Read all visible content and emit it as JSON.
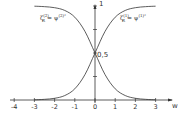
{
  "chart_data": {
    "type": "line",
    "title": "",
    "xlabel": "w",
    "ylabel": "",
    "xlim": [
      -4,
      3.5
    ],
    "ylim": [
      0,
      1
    ],
    "x_ticks": [
      "-4",
      "-3",
      "-2",
      "-1",
      "0",
      "1",
      "2",
      "3"
    ],
    "y_tick_labels": [
      "0,5",
      "1"
    ],
    "grid": false,
    "legend": "inline labels",
    "series": [
      {
        "name": "ζ_R^(2) = ψ^(2)²",
        "label_base": "ζ",
        "label_sup": "(2)",
        "label_sub": "R",
        "label_rhs": "= ψ",
        "label_rhs_sup": "(2)²",
        "x": [
          -3,
          -2.5,
          -2,
          -1.5,
          -1,
          -0.5,
          0,
          0.5,
          1,
          1.5,
          2,
          2.5,
          3
        ],
        "values": [
          0.998,
          0.993,
          0.982,
          0.953,
          0.881,
          0.731,
          0.5,
          0.269,
          0.119,
          0.047,
          0.018,
          0.007,
          0.002
        ]
      },
      {
        "name": "ζ_R^(1) = ψ^(1)²",
        "label_base": "ζ",
        "label_sup": "(1)",
        "label_sub": "R",
        "label_rhs": "= ψ",
        "label_rhs_sup": "(1)²",
        "x": [
          -3,
          -2.5,
          -2,
          -1.5,
          -1,
          -0.5,
          0,
          0.5,
          1,
          1.5,
          2,
          2.5,
          3
        ],
        "values": [
          0.002,
          0.007,
          0.018,
          0.047,
          0.119,
          0.269,
          0.5,
          0.731,
          0.881,
          0.953,
          0.982,
          0.993,
          0.998
        ]
      }
    ],
    "annotations": [
      "0,5 at intersection on y-axis"
    ]
  },
  "axis": {
    "x_label": "w",
    "y_top_label": "1",
    "y_mid_label": "0,5"
  }
}
